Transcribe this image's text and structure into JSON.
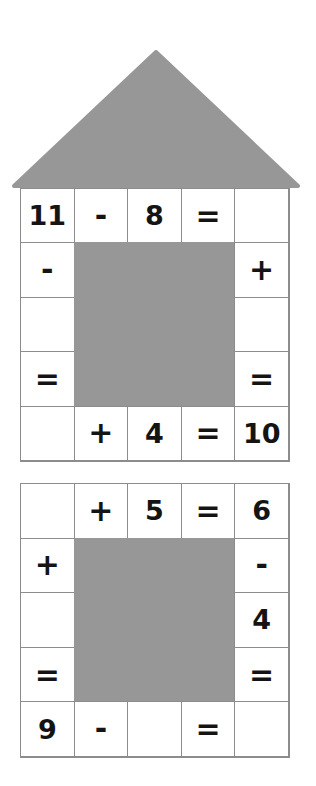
{
  "page": {
    "background_color": "#ffffff",
    "block_color": "#979797",
    "grid_line_color": "#8c8c8c",
    "text_color": "#141414"
  },
  "roof": {
    "shape_name": "house-roof-triangle",
    "fill_color": "#979797",
    "apex_x": 144,
    "base_left_x": 0,
    "base_right_x": 288,
    "height": 138
  },
  "puzzles": [
    {
      "id": "puzzle-1",
      "label": "House puzzle",
      "rows": 5,
      "columns": 5,
      "cells": [
        [
          {
            "text": "11",
            "type": "number"
          },
          {
            "text": "-",
            "type": "operator"
          },
          {
            "text": "8",
            "type": "number"
          },
          {
            "text": "=",
            "type": "operator"
          },
          {
            "text": "",
            "type": "blank"
          }
        ],
        [
          {
            "text": "-",
            "type": "operator"
          },
          {
            "text": "",
            "type": "filled"
          },
          {
            "text": "",
            "type": "filled"
          },
          {
            "text": "",
            "type": "filled"
          },
          {
            "text": "+",
            "type": "operator"
          }
        ],
        [
          {
            "text": "",
            "type": "blank"
          },
          {
            "text": "",
            "type": "filled"
          },
          {
            "text": "",
            "type": "filled"
          },
          {
            "text": "",
            "type": "filled"
          },
          {
            "text": "",
            "type": "blank"
          }
        ],
        [
          {
            "text": "=",
            "type": "operator"
          },
          {
            "text": "",
            "type": "filled"
          },
          {
            "text": "",
            "type": "filled"
          },
          {
            "text": "",
            "type": "filled"
          },
          {
            "text": "=",
            "type": "operator"
          }
        ],
        [
          {
            "text": "",
            "type": "blank"
          },
          {
            "text": "+",
            "type": "operator"
          },
          {
            "text": "4",
            "type": "number"
          },
          {
            "text": "=",
            "type": "operator"
          },
          {
            "text": "10",
            "type": "number"
          }
        ]
      ]
    },
    {
      "id": "puzzle-2",
      "label": "Second puzzle",
      "rows": 5,
      "columns": 5,
      "cells": [
        [
          {
            "text": "",
            "type": "blank"
          },
          {
            "text": "+",
            "type": "operator"
          },
          {
            "text": "5",
            "type": "number"
          },
          {
            "text": "=",
            "type": "operator"
          },
          {
            "text": "6",
            "type": "number"
          }
        ],
        [
          {
            "text": "+",
            "type": "operator"
          },
          {
            "text": "",
            "type": "filled"
          },
          {
            "text": "",
            "type": "filled"
          },
          {
            "text": "",
            "type": "filled"
          },
          {
            "text": "-",
            "type": "operator"
          }
        ],
        [
          {
            "text": "",
            "type": "blank"
          },
          {
            "text": "",
            "type": "filled"
          },
          {
            "text": "",
            "type": "filled"
          },
          {
            "text": "",
            "type": "filled"
          },
          {
            "text": "4",
            "type": "number"
          }
        ],
        [
          {
            "text": "=",
            "type": "operator"
          },
          {
            "text": "",
            "type": "filled"
          },
          {
            "text": "",
            "type": "filled"
          },
          {
            "text": "",
            "type": "filled"
          },
          {
            "text": "=",
            "type": "operator"
          }
        ],
        [
          {
            "text": "9",
            "type": "number"
          },
          {
            "text": "-",
            "type": "operator"
          },
          {
            "text": "",
            "type": "blank"
          },
          {
            "text": "=",
            "type": "operator"
          },
          {
            "text": "",
            "type": "blank"
          }
        ]
      ]
    }
  ]
}
